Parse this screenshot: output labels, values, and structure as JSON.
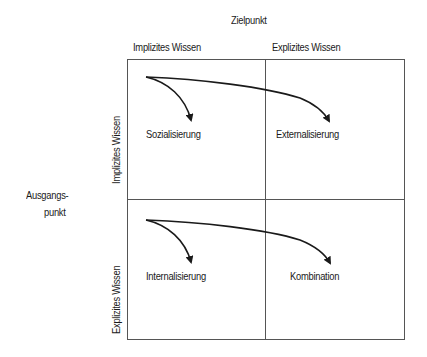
{
  "diagram": {
    "title_top": "Zielpunkt",
    "title_left": [
      "Ausgangs-",
      "punkt"
    ],
    "columns": [
      "Implizites Wissen",
      "Explizites Wissen"
    ],
    "rows": [
      "Implizites Wissen",
      "Explizites Wissen"
    ],
    "quadrants": {
      "top_left": "Sozialisierung",
      "top_right": "Externalisierung",
      "bottom_left": "Internalisierung",
      "bottom_right": "Kombination"
    },
    "colors": {
      "line": "#1a1a1a",
      "grid": "#555555",
      "background": "#ffffff"
    }
  }
}
